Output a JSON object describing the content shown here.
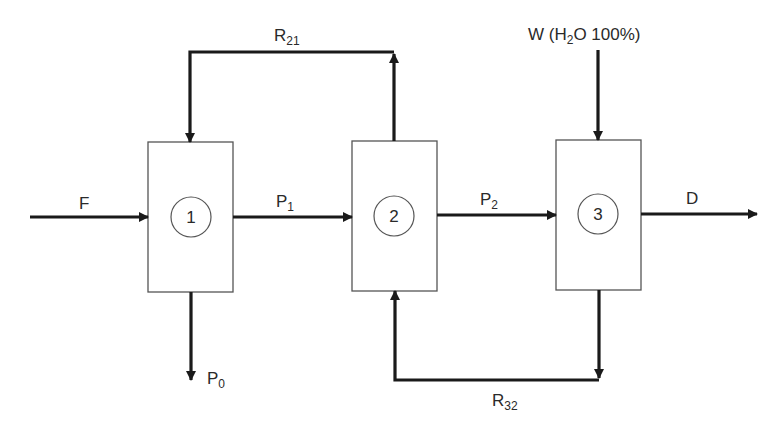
{
  "diagram": {
    "type": "process-flow",
    "units": [
      {
        "id": "1",
        "label": "1"
      },
      {
        "id": "2",
        "label": "2"
      },
      {
        "id": "3",
        "label": "3"
      }
    ],
    "streams": {
      "F": {
        "base": "F",
        "sub": "",
        "from": "feed",
        "to": "1"
      },
      "P1": {
        "base": "P",
        "sub": "1",
        "from": "1",
        "to": "2"
      },
      "P2": {
        "base": "P",
        "sub": "2",
        "from": "2",
        "to": "3"
      },
      "D": {
        "base": "D",
        "sub": "",
        "from": "3",
        "to": "out"
      },
      "P0": {
        "base": "P",
        "sub": "0",
        "from": "1",
        "to": "out"
      },
      "R21": {
        "base": "R",
        "sub": "21",
        "from": "2",
        "to": "1"
      },
      "R32": {
        "base": "R",
        "sub": "32",
        "from": "3",
        "to": "2"
      },
      "W": {
        "prefix": "W (H",
        "sub": "2",
        "suffix": "O 100%)",
        "from": "feed",
        "to": "3"
      }
    },
    "colors": {
      "line": "#1a1a1a",
      "box": "#555555",
      "text": "#2a2a2a"
    }
  }
}
